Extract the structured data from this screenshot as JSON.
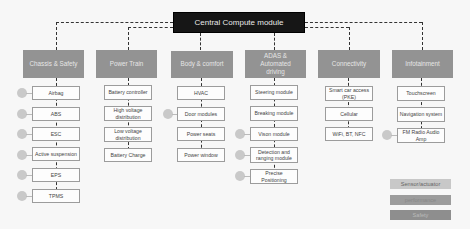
{
  "central": {
    "label": "Central Compute module"
  },
  "columns": [
    {
      "header": "Chassis & Safety",
      "items": [
        "Airbag",
        "ABS",
        "ESC",
        "Active suspension",
        "EPS",
        "TPMS"
      ]
    },
    {
      "header": "Power Train",
      "items": [
        "Battery controller",
        "High voltage distribution",
        "Low voltage distribution",
        "Battery Charge"
      ]
    },
    {
      "header": "Body & comfort",
      "items": [
        "HVAC",
        "Door modules",
        "Power seats",
        "Power window"
      ]
    },
    {
      "header": "ADAS & Automated driving",
      "items": [
        "Steering module",
        "Breaking module",
        "Vison module",
        "Detection and ranging module",
        "Precise Positioning"
      ]
    },
    {
      "header": "Connectivity",
      "items": [
        "Smart car access (PKE)",
        "Cellular",
        "WiFi, BT, NFC"
      ]
    },
    {
      "header": "Infotainment",
      "items": [
        "Touchscreen",
        "Navigation system",
        "FM Radio Audio Amp"
      ]
    }
  ],
  "legend": [
    {
      "label": "Sensor/actuator",
      "color": "#c8c8c8"
    },
    {
      "label": "performance",
      "color": "#9c9c9c"
    },
    {
      "label": "Safety",
      "color": "#8e8e8e"
    }
  ],
  "colors": {
    "central": "#161616",
    "header": "#939393",
    "sensor_dot": "#c9c9c9"
  }
}
